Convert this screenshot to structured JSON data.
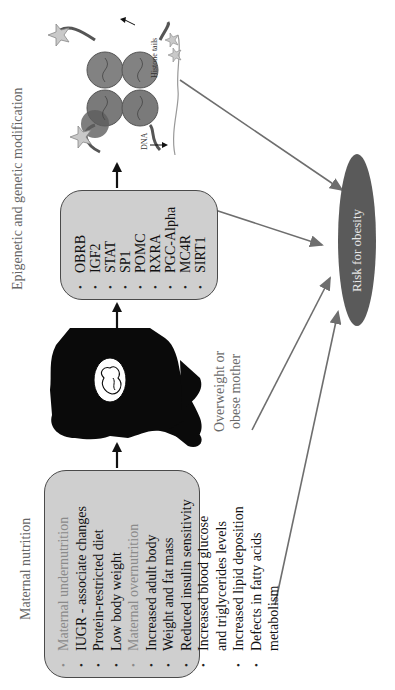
{
  "figure": {
    "orientation": "rotated-90-ccw",
    "colors": {
      "box_fill": "#cfcfcf",
      "box_border": "#4a4a4a",
      "ellipse_fill": "#5a5a5a",
      "arrow_gray": "#6e6e6e",
      "arrow_black": "#111111",
      "muted_text": "#8a8a8a"
    }
  },
  "nutrition": {
    "title": "Maternal nutrition",
    "items": [
      {
        "text": "Maternal undernutrition",
        "style": "muted"
      },
      {
        "text": "IUGR - associate changes",
        "style": "normal"
      },
      {
        "text": "Protein-restricted diet",
        "style": "normal"
      },
      {
        "text": "Low body weight",
        "style": "normal"
      },
      {
        "text": "Maternal overnutrition",
        "style": "muted"
      },
      {
        "text": "Increased adult body",
        "style": "normal"
      },
      {
        "text": "Weight and fat mass",
        "style": "normal"
      },
      {
        "text": "Reduced insulin sensitivity",
        "style": "normal"
      },
      {
        "text": "Increased blood glucose",
        "style": "normal"
      },
      {
        "text": "and triglycerides levels",
        "style": "continuation"
      },
      {
        "text": "Increased lipid deposition",
        "style": "normal"
      },
      {
        "text": "Defects in fatty acids",
        "style": "normal"
      },
      {
        "text": "metabolism",
        "style": "continuation"
      }
    ]
  },
  "mother": {
    "icon": "pregnant-woman-silhouette-icon",
    "label_line1": "Overweight or",
    "label_line2": "obese mother"
  },
  "genes": {
    "title": "Epigenetic and genetic modification",
    "items": [
      "OBRB",
      "IGF2",
      "STAT",
      "SP1",
      "POMC",
      "RXRA",
      "PGC-Alpha",
      "MC4R",
      "SIRT1"
    ]
  },
  "nucleosome": {
    "icon": "nucleosome-histone-icon",
    "histone_label": "Histone tails",
    "dna_label": "DNA"
  },
  "outcome": {
    "label": "Risk for obesity"
  }
}
